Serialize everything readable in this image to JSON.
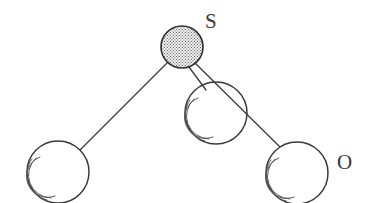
{
  "figure": {
    "kind": "molecular-structure-diagram",
    "background_color": "#ffffff",
    "line_color": "#3a3a3a",
    "sphere_fill": "#ffffff",
    "sulfur_fill_color": "#cfcfcf",
    "label_color": "#3a3a3a",
    "width": 375,
    "height": 203
  },
  "labels": {
    "sulfur": "S",
    "oxygen": "O"
  },
  "atoms": [
    {
      "id": "sulfur-atom",
      "element": "S",
      "label": "S",
      "cx": 182,
      "cy": 47,
      "r": 21,
      "style": "stippled",
      "fill": "#cfcfcf",
      "shaded": false
    },
    {
      "id": "oxygen-atom-left",
      "element": "O",
      "label": "",
      "cx": 58,
      "cy": 172,
      "r": 31,
      "style": "outline",
      "fill": "#ffffff",
      "shaded": true
    },
    {
      "id": "oxygen-atom-center",
      "element": "O",
      "label": "",
      "cx": 216,
      "cy": 113,
      "r": 31,
      "style": "outline",
      "fill": "#ffffff",
      "shaded": true
    },
    {
      "id": "oxygen-atom-right",
      "element": "O",
      "label": "O",
      "cx": 297,
      "cy": 173,
      "r": 31,
      "style": "outline",
      "fill": "#ffffff",
      "shaded": true
    }
  ],
  "bonds": [
    {
      "id": "bond-s-o-left",
      "from": "sulfur-atom",
      "to": "oxygen-atom-left",
      "x1": 167,
      "y1": 63,
      "x2": 80,
      "y2": 150
    },
    {
      "id": "bond-s-o-center",
      "from": "sulfur-atom",
      "to": "oxygen-atom-center",
      "x1": 189,
      "y1": 67,
      "x2": 205,
      "y2": 88
    },
    {
      "id": "bond-s-o-right",
      "from": "sulfur-atom",
      "to": "oxygen-atom-right",
      "x1": 195,
      "y1": 63,
      "x2": 281,
      "y2": 148
    }
  ]
}
